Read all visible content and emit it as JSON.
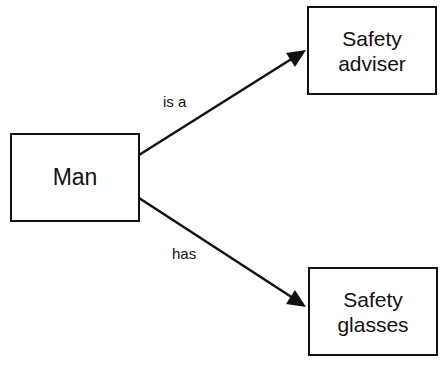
{
  "diagram": {
    "type": "concept-map",
    "nodes": [
      {
        "id": "man",
        "label": "Man"
      },
      {
        "id": "adviser",
        "label": "Safety\nadviser"
      },
      {
        "id": "glasses",
        "label": "Safety\nglasses"
      }
    ],
    "edges": [
      {
        "from": "man",
        "to": "adviser",
        "label": "is a"
      },
      {
        "from": "man",
        "to": "glasses",
        "label": "has"
      }
    ],
    "colors": {
      "stroke": "#111111",
      "background": "#ffffff"
    }
  }
}
